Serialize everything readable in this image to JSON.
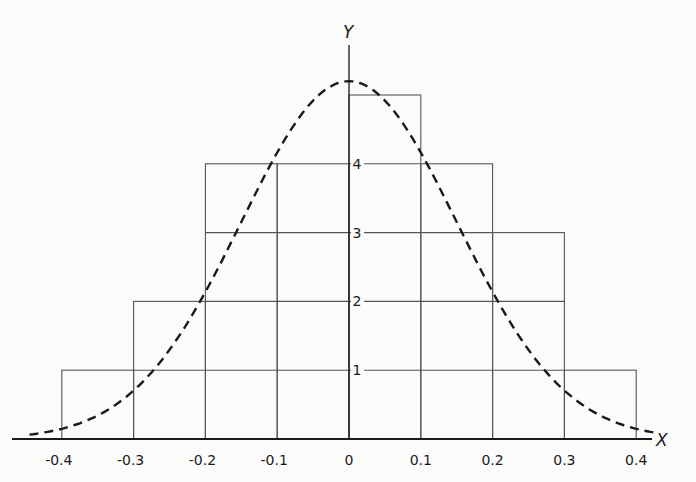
{
  "chart_data": {
    "type": "bar",
    "subtype": "histogram with fitted normal curve",
    "title": "",
    "xlabel": "X",
    "ylabel": "Y",
    "x_ticks": [
      "-0.4",
      "-0.3",
      "-0.2",
      "-0.1",
      "0",
      "0.1",
      "0.2",
      "0.3",
      "0.4"
    ],
    "y_ticks": [
      "1",
      "2",
      "3",
      "4"
    ],
    "xlim": [
      -0.44,
      0.44
    ],
    "ylim": [
      0,
      5.5
    ],
    "grid": false,
    "bins": [
      {
        "from": -0.4,
        "to": -0.3,
        "value": 1
      },
      {
        "from": -0.3,
        "to": -0.2,
        "value": 2
      },
      {
        "from": -0.2,
        "to": -0.1,
        "value": 4
      },
      {
        "from": -0.1,
        "to": 0.0,
        "value": 4
      },
      {
        "from": 0.0,
        "to": 0.1,
        "value": 5
      },
      {
        "from": 0.1,
        "to": 0.2,
        "value": 4
      },
      {
        "from": 0.2,
        "to": 0.3,
        "value": 3
      },
      {
        "from": 0.3,
        "to": 0.4,
        "value": 1
      }
    ],
    "categories": [
      "-0.4 to -0.3",
      "-0.3 to -0.2",
      "-0.2 to -0.1",
      "-0.1 to 0",
      "0 to 0.1",
      "0.1 to 0.2",
      "0.2 to 0.3",
      "0.3 to 0.4"
    ],
    "values": [
      1,
      2,
      4,
      4,
      5,
      4,
      3,
      1
    ],
    "series": [
      {
        "name": "histogram",
        "values": [
          1,
          2,
          4,
          4,
          5,
          4,
          3,
          1
        ]
      },
      {
        "name": "normal curve (dashed)",
        "style": "dashed",
        "peak": {
          "x": 0.0,
          "y": 5.2
        },
        "sigma": 0.15,
        "points": [
          [
            -0.44,
            0.2
          ],
          [
            -0.4,
            0.4
          ],
          [
            -0.3,
            1.0
          ],
          [
            -0.2,
            2.25
          ],
          [
            -0.1,
            4.1
          ],
          [
            0.0,
            5.2
          ],
          [
            0.1,
            4.6
          ],
          [
            0.2,
            2.45
          ],
          [
            0.3,
            1.0
          ],
          [
            0.4,
            0.25
          ],
          [
            0.44,
            0.1
          ]
        ]
      }
    ],
    "legend": null
  },
  "colors": {
    "ink": "#1a1a1a",
    "grid_line": "#555555",
    "background": "#fbfbfa"
  }
}
